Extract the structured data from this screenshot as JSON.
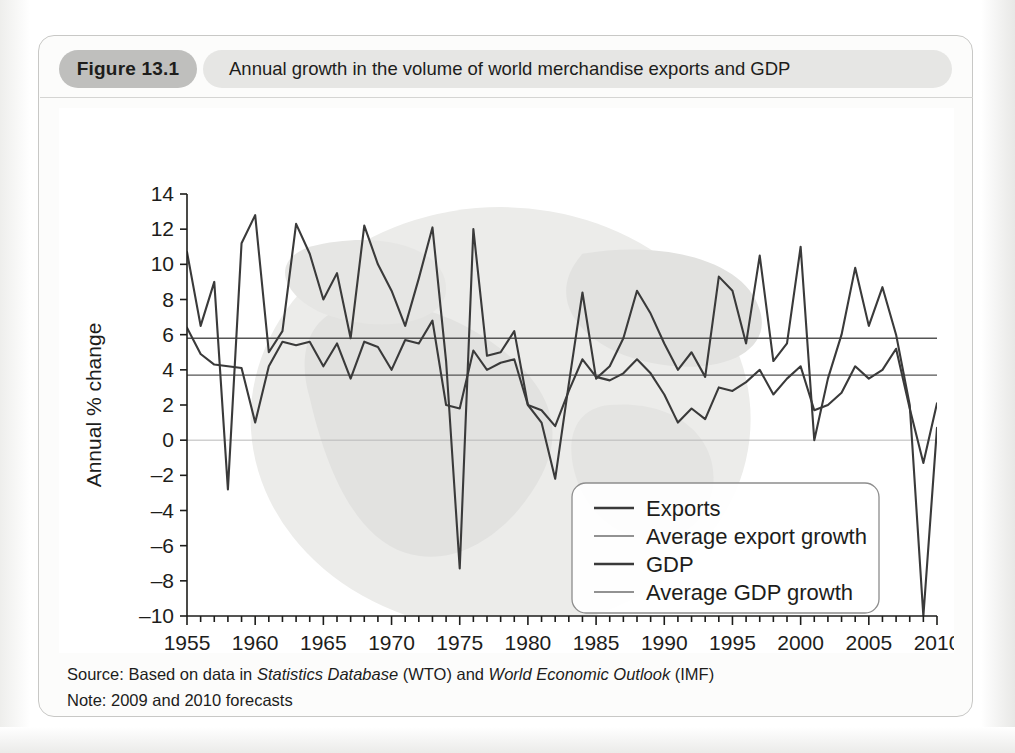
{
  "figure": {
    "number_label": "Figure 13.1",
    "title": "Annual growth in the volume of world merchandise exports and GDP",
    "source_prefix": "Source: Based on data in ",
    "source_italic_1": "Statistics Database",
    "source_mid": " (WTO) and ",
    "source_italic_2": "World Economic Outlook",
    "source_suffix": " (IMF)",
    "note": "Note: 2009 and 2010 forecasts"
  },
  "colors": {
    "figure_number_bg": "#bfbfbd",
    "figure_title_bg": "#e6e6e4",
    "series_dark": "#3a3a3a",
    "series_mid": "#6e6e6e",
    "average_line": "#555555",
    "zero_line": "#b8b8b8",
    "axis": "#1d1d1b",
    "watermark": "#ececea",
    "panel_bg": "#fcfcfb"
  },
  "chart_data": {
    "type": "line",
    "title": "Annual growth in the volume of world merchandise exports and GDP",
    "xlabel": "",
    "ylabel": "Annual % change",
    "xlim": [
      1955,
      2010
    ],
    "ylim": [
      -10,
      14
    ],
    "ytick_step": 2,
    "yticks": [
      -10,
      -8,
      -6,
      -4,
      -2,
      0,
      2,
      4,
      6,
      8,
      10,
      12,
      14
    ],
    "xticks_major": [
      1955,
      1960,
      1965,
      1970,
      1975,
      1980,
      1985,
      1990,
      1995,
      2000,
      2005,
      2010
    ],
    "xtick_minor_step": 1,
    "grid": false,
    "zero_line": true,
    "legend_position": "inside-lower-right",
    "legend": [
      {
        "label": "Exports",
        "style": "thick-dark"
      },
      {
        "label": "Average export growth",
        "style": "thin-mid"
      },
      {
        "label": "GDP",
        "style": "thick-dark"
      },
      {
        "label": "Average GDP growth",
        "style": "thin-mid"
      }
    ],
    "averages": {
      "export_growth": 5.8,
      "gdp_growth": 3.7
    },
    "x": [
      1955,
      1956,
      1957,
      1958,
      1959,
      1960,
      1961,
      1962,
      1963,
      1964,
      1965,
      1966,
      1967,
      1968,
      1969,
      1970,
      1971,
      1972,
      1973,
      1974,
      1975,
      1976,
      1977,
      1978,
      1979,
      1980,
      1981,
      1982,
      1983,
      1984,
      1985,
      1986,
      1987,
      1988,
      1989,
      1990,
      1991,
      1992,
      1993,
      1994,
      1995,
      1996,
      1997,
      1998,
      1999,
      2000,
      2001,
      2002,
      2003,
      2004,
      2005,
      2006,
      2007,
      2008,
      2009,
      2010
    ],
    "series": [
      {
        "name": "Exports",
        "values": [
          10.7,
          6.5,
          9.0,
          -2.8,
          11.2,
          12.8,
          5.0,
          6.2,
          12.3,
          10.6,
          8.0,
          9.5,
          5.8,
          12.2,
          10.0,
          8.5,
          6.5,
          9.2,
          12.1,
          4.5,
          -7.3,
          12.0,
          4.8,
          5.0,
          6.2,
          2.0,
          1.0,
          -2.2,
          3.2,
          8.4,
          3.5,
          4.2,
          5.8,
          8.5,
          7.2,
          5.5,
          4.0,
          5.0,
          3.6,
          9.3,
          8.5,
          5.5,
          10.5,
          4.5,
          5.5,
          11.0,
          0.0,
          3.5,
          6.0,
          9.8,
          6.5,
          8.7,
          6.0,
          2.0,
          -10.0,
          0.7
        ]
      },
      {
        "name": "GDP",
        "values": [
          6.4,
          4.9,
          4.3,
          4.2,
          4.1,
          1.0,
          4.2,
          5.6,
          5.4,
          5.6,
          4.2,
          5.5,
          3.5,
          5.6,
          5.3,
          4.0,
          5.7,
          5.5,
          6.8,
          2.0,
          1.8,
          5.1,
          4.0,
          4.4,
          4.6,
          2.0,
          1.7,
          0.8,
          2.8,
          4.6,
          3.6,
          3.4,
          3.8,
          4.6,
          3.8,
          2.6,
          1.0,
          1.8,
          1.2,
          3.0,
          2.8,
          3.3,
          4.0,
          2.6,
          3.5,
          4.2,
          1.7,
          2.0,
          2.7,
          4.2,
          3.5,
          4.0,
          5.2,
          1.8,
          -1.3,
          2.1
        ]
      }
    ]
  }
}
